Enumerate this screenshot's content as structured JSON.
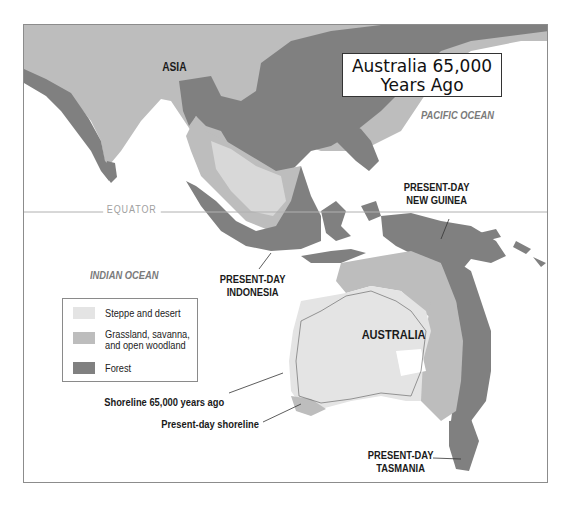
{
  "title": {
    "line1": "Australia 65,000",
    "line2": "Years Ago"
  },
  "regions": {
    "asia": "ASIA",
    "australia": "AUSTRALIA",
    "new_guinea": {
      "line1": "PRESENT-DAY",
      "line2": "NEW GUINEA"
    },
    "indonesia": {
      "line1": "PRESENT-DAY",
      "line2": "INDONESIA"
    },
    "tasmania": {
      "line1": "PRESENT-DAY",
      "line2": "TASMANIA"
    }
  },
  "oceans": {
    "pacific": "PACIFIC OCEAN",
    "indian": "INDIAN OCEAN"
  },
  "equator_label": "EQUATOR",
  "legend": {
    "items": [
      {
        "label": "Steppe and desert",
        "color": "#e4e4e4"
      },
      {
        "label_line1": "Grassland, savanna,",
        "label_line2": "and open woodland",
        "color": "#bdbdbd"
      },
      {
        "label": "Forest",
        "color": "#808080"
      }
    ]
  },
  "callouts": {
    "shoreline_past": "Shoreline 65,000 years ago",
    "shoreline_present": "Present-day shoreline"
  },
  "colors": {
    "steppe": "#e4e4e4",
    "grassland": "#bdbdbd",
    "forest": "#808080",
    "border": "#8c8c8c"
  }
}
